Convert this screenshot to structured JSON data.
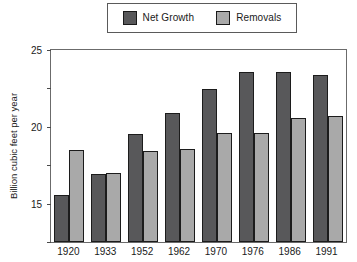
{
  "chart_data": {
    "type": "bar",
    "title": "",
    "xlabel": "",
    "ylabel": "Billion cubic feet per year",
    "categories": [
      "1920",
      "1933",
      "1952",
      "1962",
      "1970",
      "1976",
      "1986",
      "1991"
    ],
    "series": [
      {
        "name": "Net Growth",
        "color": "#58585a",
        "values": [
          6.1,
          8.8,
          14.1,
          16.8,
          19.9,
          22.1,
          22.1,
          21.8
        ]
      },
      {
        "name": "Removals",
        "color": "#a9a9a9",
        "values": [
          12.0,
          9.0,
          11.9,
          12.1,
          14.2,
          14.2,
          16.1,
          16.4
        ]
      }
    ],
    "ylim": [
      0,
      25
    ],
    "yticks": [
      0,
      5,
      10,
      15,
      20,
      25
    ],
    "ytick_labels": [
      "0",
      "5",
      "10",
      "15",
      "20",
      "25"
    ],
    "grid": false,
    "legend_position": "top-center"
  },
  "legend": {
    "entries": [
      {
        "label": "Net Growth",
        "swatch": "dark-gray-swatch"
      },
      {
        "label": "Removals",
        "swatch": "light-gray-swatch"
      }
    ]
  },
  "colors": {
    "net_growth": "#58585a",
    "removals": "#a9a9a9",
    "frame": "#6b6b6b",
    "text": "#1a1a1a",
    "background": "#ffffff"
  }
}
